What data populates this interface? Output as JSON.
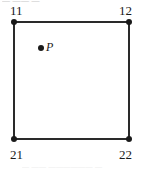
{
  "figure": {
    "type": "square-cell-diagram",
    "colors": {
      "edge": "#2a2a2a",
      "vertex": "#1a1a1a",
      "label": "#1a1a1a",
      "background": "#ffffff"
    },
    "square": {
      "corners": [
        {
          "id": "11",
          "label": "11",
          "position": "top-left",
          "x": 13,
          "y": 21
        },
        {
          "id": "12",
          "label": "12",
          "position": "top-right",
          "x": 129,
          "y": 21
        },
        {
          "id": "21",
          "label": "21",
          "position": "bottom-left",
          "x": 13,
          "y": 139
        },
        {
          "id": "22",
          "label": "22",
          "position": "bottom-right",
          "x": 129,
          "y": 139
        }
      ],
      "edges": [
        "top",
        "right",
        "bottom",
        "left"
      ]
    },
    "interior_point": {
      "label": "P",
      "x": 41,
      "y": 48,
      "style": "filled-dot"
    },
    "text_remnants": {
      "top": "— —— —",
      "bottom": "—  ——  ——————  —"
    }
  }
}
